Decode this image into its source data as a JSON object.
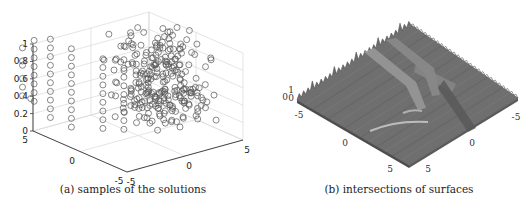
{
  "figure": {
    "panels": [
      {
        "id": "a",
        "caption": "(a) samples of the solutions"
      },
      {
        "id": "b",
        "caption": "(b) intersections of surfaces"
      }
    ]
  },
  "chart_data": [
    {
      "type": "scatter",
      "subtype": "3d-scatter",
      "title": "",
      "caption": "(a) samples of the solutions",
      "marker": "open-circle",
      "grid": true,
      "xlim": [
        -5,
        5
      ],
      "ylim": [
        -5,
        5
      ],
      "zlim": [
        0,
        1
      ],
      "x_ticks": [
        "-5",
        "0",
        "5"
      ],
      "y_ticks": [
        "-5",
        "0",
        "5"
      ],
      "z_ticks": [
        "0",
        "0.2",
        "0.4",
        "0.6",
        "0.8",
        "1"
      ],
      "xlabel": "",
      "ylabel": "",
      "zlabel": "",
      "columns_note": "approximate sample columns (x, y) with z-levels; dense block near x≈3..6",
      "columns": [
        {
          "x": -5.5,
          "y": 5.5,
          "z": [
            0.4,
            0.5,
            0.6,
            0.75,
            0.8,
            0.95
          ],
          "extra": [
            [
              -5.2,
              5.0,
              0.38
            ]
          ]
        },
        {
          "x": -4.5,
          "y": 5.5,
          "z": [
            0.3,
            0.4,
            0.5,
            0.6,
            0.7,
            0.8,
            0.9,
            1.0
          ]
        },
        {
          "x": -3.5,
          "y": 5.0,
          "z": [
            0.1,
            0.2,
            0.3,
            0.4,
            0.5,
            0.6,
            0.7,
            0.8,
            0.9,
            1.0
          ]
        },
        {
          "x": -2.5,
          "y": 4.0,
          "z": [
            0.0,
            0.1,
            0.2,
            0.3,
            0.4,
            0.5,
            0.6,
            0.7,
            0.8,
            0.9
          ]
        },
        {
          "x": -1.0,
          "y": 2.5,
          "z": [
            0.0,
            0.1,
            0.2,
            0.3,
            0.4,
            0.5,
            0.6,
            0.7,
            0.8
          ]
        },
        {
          "x": 0.0,
          "y": 1.5,
          "z": [
            0.0,
            0.1,
            0.2,
            0.3,
            0.4,
            0.5,
            0.6,
            0.7,
            0.8
          ]
        }
      ],
      "dense_block": {
        "x_range": [
          1,
          6
        ],
        "y_range": [
          -1,
          5
        ],
        "z_range": [
          0.0,
          0.9
        ]
      }
    },
    {
      "type": "surface",
      "subtype": "3d-surface",
      "title": "",
      "caption": "(b) intersections of surfaces",
      "colormap": "gray",
      "xlim": [
        -5,
        5
      ],
      "ylim": [
        -5,
        5
      ],
      "zlim": [
        0,
        1
      ],
      "x_ticks": [
        "-5",
        "0",
        "5"
      ],
      "y_ticks": [
        "5",
        "0",
        "-5"
      ],
      "z_ticks": [
        "0",
        "0.5",
        "1"
      ],
      "z_tick_display": [
        "0",
        "½",
        "1"
      ],
      "xlabel": "",
      "ylabel": "",
      "zlabel": ""
    }
  ]
}
